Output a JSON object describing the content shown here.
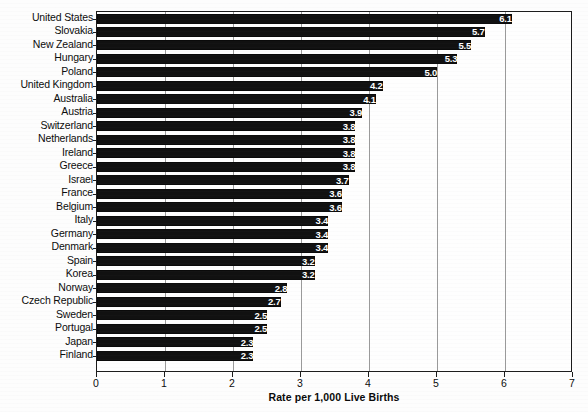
{
  "chart_data": {
    "type": "bar",
    "orientation": "horizontal",
    "title": "",
    "xlabel": "Rate per 1,000 Live Births",
    "ylabel": "",
    "xlim": [
      0,
      7
    ],
    "xticks": [
      "0",
      "1",
      "2",
      "3",
      "4",
      "5",
      "6",
      "7"
    ],
    "grid": true,
    "legend": false,
    "value_label_color": "#ffffff",
    "bar_color": "#111111",
    "categories": [
      "United States",
      "Slovakia",
      "New Zealand",
      "Hungary",
      "Poland",
      "United Kingdom",
      "Australia",
      "Austria",
      "Switzerland",
      "Netherlands",
      "Ireland",
      "Greece",
      "Israel",
      "France",
      "Belgium",
      "Italy",
      "Germany",
      "Denmark",
      "Spain",
      "Korea",
      "Norway",
      "Czech Republic",
      "Sweden",
      "Portugal",
      "Japan",
      "Finland"
    ],
    "values": [
      6.1,
      5.7,
      5.5,
      5.3,
      5.0,
      4.2,
      4.1,
      3.9,
      3.8,
      3.8,
      3.8,
      3.8,
      3.7,
      3.6,
      3.6,
      3.4,
      3.4,
      3.4,
      3.2,
      3.2,
      2.8,
      2.7,
      2.5,
      2.5,
      2.3,
      2.3
    ],
    "value_labels": [
      "6.1",
      "5.7",
      "5.5",
      "5.3",
      "5.0",
      "4.2",
      "4.1",
      "3.9",
      "3.8",
      "3.8",
      "3.8",
      "3.8",
      "3.7",
      "3.6",
      "3.6",
      "3.4",
      "3.4",
      "3.4",
      "3.2",
      "3.2",
      "2.8",
      "2.7",
      "2.5",
      "2.5",
      "2.3",
      "2.3"
    ]
  }
}
